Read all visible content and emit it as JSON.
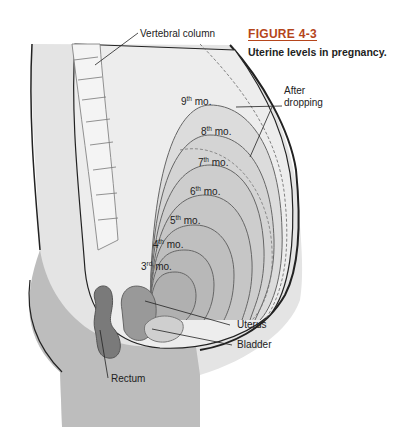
{
  "figure": {
    "number": "FIGURE 4-3",
    "caption": "Uterine levels in pregnancy.",
    "accent_color": "#b5451b"
  },
  "labels": {
    "vertebral_column": "Vertebral column",
    "after_dropping": "After dropping",
    "after_dropping_line1": "After",
    "after_dropping_line2": "dropping",
    "uterus": "Uterus",
    "bladder": "Bladder",
    "rectum": "Rectum"
  },
  "months": [
    {
      "num": "9",
      "suffix": "th",
      "unit": "mo."
    },
    {
      "num": "8",
      "suffix": "th",
      "unit": "mo."
    },
    {
      "num": "7",
      "suffix": "th",
      "unit": "mo."
    },
    {
      "num": "6",
      "suffix": "th",
      "unit": "mo."
    },
    {
      "num": "5",
      "suffix": "th",
      "unit": "mo."
    },
    {
      "num": "4",
      "suffix": "th",
      "unit": "mo."
    },
    {
      "num": "3",
      "suffix": "rd",
      "unit": "mo."
    }
  ]
}
